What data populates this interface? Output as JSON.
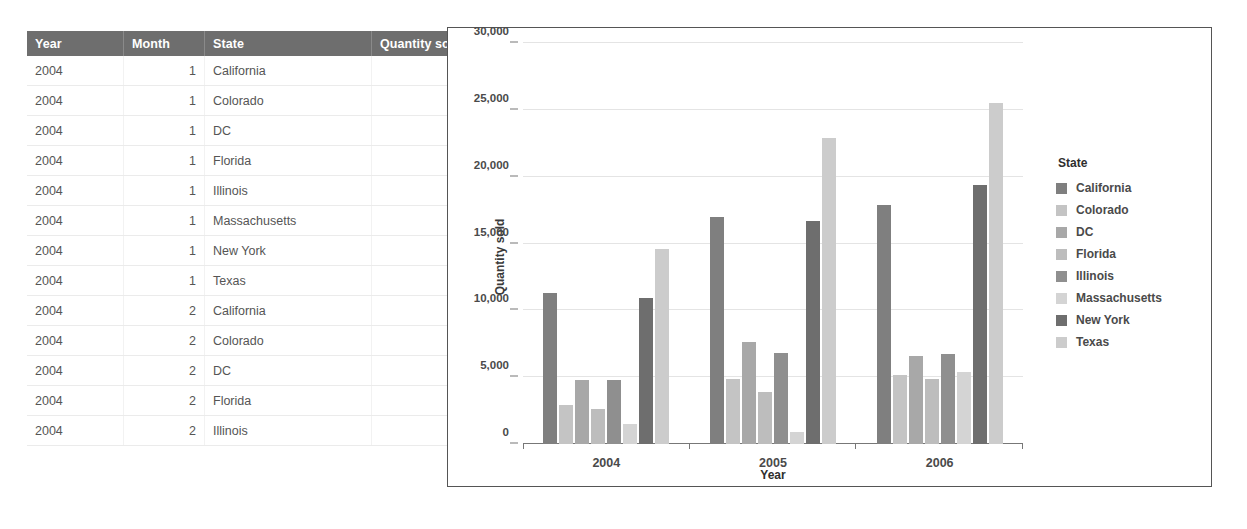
{
  "table": {
    "columns": [
      "Year",
      "Month",
      "State",
      "Quantity sold"
    ],
    "rows": [
      {
        "year": "2004",
        "month": "1",
        "state": "California",
        "quantity": "1,185"
      },
      {
        "year": "2004",
        "month": "1",
        "state": "Colorado",
        "quantity": "309"
      },
      {
        "year": "2004",
        "month": "1",
        "state": "DC",
        "quantity": "542"
      },
      {
        "year": "2004",
        "month": "1",
        "state": "Florida",
        "quantity": "378"
      },
      {
        "year": "2004",
        "month": "1",
        "state": "Illinois",
        "quantity": "670"
      },
      {
        "year": "2004",
        "month": "1",
        "state": "Massachusetts",
        "quantity": "236"
      },
      {
        "year": "2004",
        "month": "1",
        "state": "New York",
        "quantity": "1,483"
      },
      {
        "year": "2004",
        "month": "1",
        "state": "Texas",
        "quantity": "2,094"
      },
      {
        "year": "2004",
        "month": "2",
        "state": "California",
        "quantity": "921"
      },
      {
        "year": "2004",
        "month": "2",
        "state": "Colorado",
        "quantity": "261"
      },
      {
        "year": "2004",
        "month": "2",
        "state": "DC",
        "quantity": "364"
      },
      {
        "year": "2004",
        "month": "2",
        "state": "Florida",
        "quantity": "230"
      },
      {
        "year": "2004",
        "month": "2",
        "state": "Illinois",
        "quantity": "463"
      }
    ]
  },
  "chart_data": {
    "type": "bar",
    "title": "",
    "xlabel": "Year",
    "ylabel": "Quantity sold",
    "categories": [
      "2004",
      "2005",
      "2006"
    ],
    "ylim": [
      0,
      30000
    ],
    "yticks": [
      0,
      5000,
      10000,
      15000,
      20000,
      25000,
      30000
    ],
    "ytick_labels": [
      "0",
      "5,000",
      "10,000",
      "15,000",
      "20,000",
      "25,000",
      "30,000"
    ],
    "grid": true,
    "legend_position": "right",
    "legend_title": "State",
    "series": [
      {
        "name": "California",
        "color": "#7f7f7f",
        "values": [
          11300,
          17000,
          17900
        ]
      },
      {
        "name": "Colorado",
        "color": "#c4c4c4",
        "values": [
          2900,
          4900,
          5200
        ]
      },
      {
        "name": "DC",
        "color": "#a8a8a8",
        "values": [
          4800,
          7600,
          6600
        ]
      },
      {
        "name": "Florida",
        "color": "#bdbdbd",
        "values": [
          2600,
          3900,
          4900
        ]
      },
      {
        "name": "Illinois",
        "color": "#8f8f8f",
        "values": [
          4800,
          6800,
          6700
        ]
      },
      {
        "name": "Massachusetts",
        "color": "#d4d4d4",
        "values": [
          1500,
          900,
          5400
        ]
      },
      {
        "name": "New York",
        "color": "#6e6e6e",
        "values": [
          10900,
          16700,
          19400
        ]
      },
      {
        "name": "Texas",
        "color": "#cccccc",
        "values": [
          14600,
          22900,
          25500
        ]
      }
    ]
  }
}
